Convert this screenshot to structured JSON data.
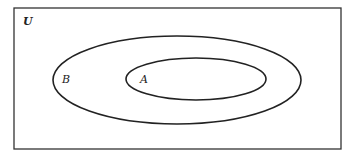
{
  "diagram": {
    "type": "venn",
    "title": "",
    "universe": {
      "label": "U"
    },
    "sets": [
      {
        "id": "B",
        "label": "B",
        "contains": [
          "A"
        ]
      },
      {
        "id": "A",
        "label": "A",
        "subset_of": "B"
      }
    ],
    "relation": "A ⊂ B ⊂ U",
    "colors": {
      "stroke": "#222222",
      "background": "#ffffff"
    }
  }
}
